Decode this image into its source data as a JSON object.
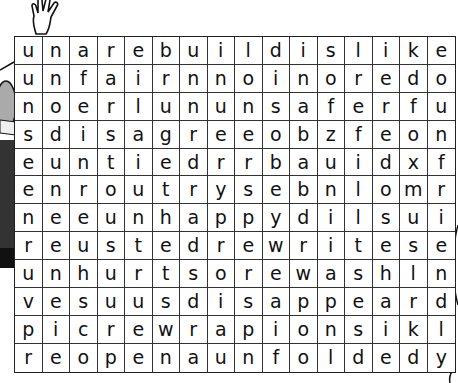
{
  "puzzle": {
    "type": "word-search",
    "rows": 12,
    "cols": 16,
    "grid": [
      [
        "u",
        "n",
        "a",
        "r",
        "e",
        "b",
        "u",
        "i",
        "l",
        "d",
        "i",
        "s",
        "l",
        "i",
        "k",
        "e"
      ],
      [
        "u",
        "n",
        "f",
        "a",
        "i",
        "r",
        "n",
        "n",
        "o",
        "i",
        "n",
        "o",
        "r",
        "e",
        "d",
        "o"
      ],
      [
        "n",
        "o",
        "e",
        "r",
        "l",
        "u",
        "n",
        "u",
        "n",
        "s",
        "a",
        "f",
        "e",
        "r",
        "f",
        "u"
      ],
      [
        "s",
        "d",
        "i",
        "s",
        "a",
        "g",
        "r",
        "e",
        "e",
        "o",
        "b",
        "z",
        "f",
        "e",
        "o",
        "n"
      ],
      [
        "e",
        "u",
        "n",
        "t",
        "i",
        "e",
        "d",
        "r",
        "r",
        "b",
        "a",
        "u",
        "i",
        "d",
        "x",
        "f"
      ],
      [
        "e",
        "n",
        "r",
        "o",
        "u",
        "t",
        "r",
        "y",
        "s",
        "e",
        "b",
        "n",
        "l",
        "o",
        "m",
        "r"
      ],
      [
        "n",
        "e",
        "e",
        "u",
        "n",
        "h",
        "a",
        "p",
        "p",
        "y",
        "d",
        "i",
        "l",
        "s",
        "u",
        "i"
      ],
      [
        "r",
        "e",
        "u",
        "s",
        "t",
        "e",
        "d",
        "r",
        "e",
        "w",
        "r",
        "i",
        "t",
        "e",
        "s",
        "e"
      ],
      [
        "u",
        "n",
        "h",
        "u",
        "r",
        "t",
        "s",
        "o",
        "r",
        "e",
        "w",
        "a",
        "s",
        "h",
        "l",
        "n"
      ],
      [
        "v",
        "e",
        "s",
        "u",
        "u",
        "s",
        "d",
        "i",
        "s",
        "a",
        "p",
        "p",
        "e",
        "a",
        "r",
        "d"
      ],
      [
        "p",
        "i",
        "c",
        "r",
        "e",
        "w",
        "r",
        "a",
        "p",
        "i",
        "o",
        "n",
        "s",
        "i",
        "k",
        "l"
      ],
      [
        "r",
        "e",
        "o",
        "p",
        "e",
        "n",
        "a",
        "u",
        "n",
        "f",
        "o",
        "l",
        "d",
        "e",
        "d",
        "y"
      ]
    ]
  },
  "decorations": {
    "hand": "cartoon-hand-icon",
    "left_figure": "cartoon-character-icon"
  },
  "colors": {
    "grid_line": "#333333",
    "letter": "#111111",
    "background": "#ffffff"
  }
}
